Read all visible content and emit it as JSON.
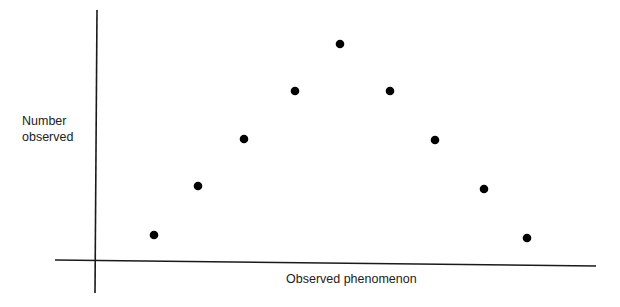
{
  "chart_data": {
    "type": "scatter",
    "title": "",
    "xlabel": "Observed phenomenon",
    "ylabel": "Number\nobserved",
    "grid": false,
    "legend": null,
    "x_ticks": [],
    "y_ticks": [],
    "series": [
      {
        "name": "observations",
        "marker": "filled-circle",
        "color": "#000000",
        "x": [
          1,
          2,
          3,
          4,
          5,
          6,
          7,
          8,
          9
        ],
        "y": [
          1,
          2,
          3,
          4,
          5,
          4,
          3,
          2,
          1
        ]
      }
    ],
    "pixel_points": [
      [
        154,
        235
      ],
      [
        198,
        186
      ],
      [
        244,
        139
      ],
      [
        295,
        91
      ],
      [
        340,
        44
      ],
      [
        390,
        91
      ],
      [
        435,
        140
      ],
      [
        484,
        189
      ],
      [
        527,
        238
      ]
    ],
    "axes": {
      "y_axis": {
        "x1": 97,
        "y1": 10,
        "x2": 95,
        "y2": 293
      },
      "x_axis": {
        "x1": 55,
        "y1": 260,
        "x2": 596,
        "y2": 266
      }
    },
    "shape": "symmetric bell-shaped / normal-like distribution",
    "colors": {
      "axis": "#1a1a1a",
      "point": "#000000",
      "text": "#222222",
      "background": "#ffffff"
    }
  }
}
